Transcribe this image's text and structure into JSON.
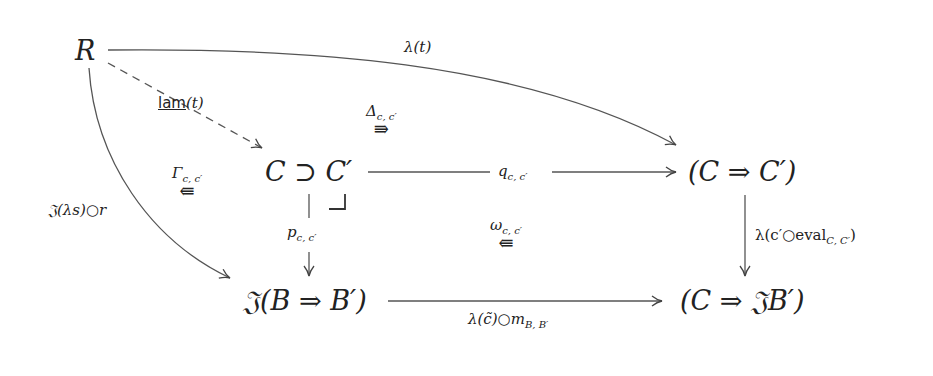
{
  "diagram": {
    "type": "commutative-diagram",
    "nodes": {
      "R": "R",
      "C_pullback": "C ⊃ C′",
      "C_exp": "(C ⇒ C′)",
      "J_B_exp": "𝔍(B ⇒ B′)",
      "C_JB": "(C ⇒ 𝔍B′)"
    },
    "edges": {
      "lambda_t": "λ(t)",
      "lam_t_name": "lam",
      "lam_t_arg": "(t)",
      "J_lambda_s_r": "𝔍(λs)○r",
      "q": "q",
      "q_sub": "c, c′",
      "p": "p",
      "p_sub": "c, c′",
      "lambda_eval": "λ(c′○eval",
      "lambda_eval_sub": "C, C′",
      "lambda_eval_close": ")",
      "lambda_ctilde": "λ(c̃)○m",
      "lambda_ctilde_sub": "B, B′"
    },
    "two_cells": {
      "delta": {
        "label": "Δ",
        "sub": "c, c′",
        "arrow": "⇛"
      },
      "gamma": {
        "label": "Γ",
        "sub": "c, c′",
        "arrow": "⇚"
      },
      "omega": {
        "label": "ω",
        "sub": "c, c′",
        "arrow": "⇚"
      }
    },
    "pullback_corner": "⌟"
  }
}
